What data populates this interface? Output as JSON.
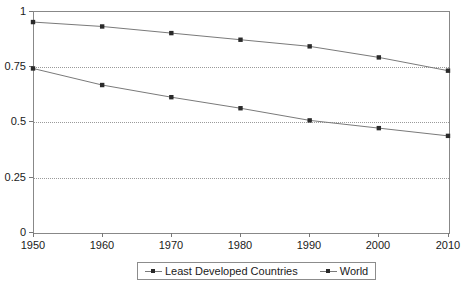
{
  "chart_data": {
    "type": "line",
    "title": "",
    "subtitle": "",
    "xlabel": "",
    "ylabel": "",
    "x": [
      1950,
      1960,
      1970,
      1980,
      1990,
      2000,
      2010
    ],
    "xtick_labels": [
      "1950",
      "1960",
      "1970",
      "1980",
      "1990",
      "2000",
      "2010"
    ],
    "ytick_labels": [
      "0",
      "0.25",
      "0.5",
      "0.75",
      "1"
    ],
    "yticks": [
      0,
      0.25,
      0.5,
      0.75,
      1
    ],
    "xlim": [
      1950,
      2010
    ],
    "ylim": [
      0,
      1
    ],
    "grid": "horizontal-dotted",
    "legend_position": "bottom-center",
    "marker": "square",
    "series": [
      {
        "name": "Least Developed Countries",
        "values": [
          0.95,
          0.93,
          0.9,
          0.87,
          0.84,
          0.79,
          0.73
        ],
        "color": "#7a7a7a",
        "marker_color": "#2a2a2a"
      },
      {
        "name": "World",
        "values": [
          0.74,
          0.665,
          0.61,
          0.56,
          0.505,
          0.47,
          0.435
        ],
        "color": "#7a7a7a",
        "marker_color": "#2a2a2a"
      }
    ]
  },
  "axes": {
    "y_labels": [
      {
        "text": "1",
        "top": 6
      },
      {
        "text": "0.75",
        "top": 61
      },
      {
        "text": "0.5",
        "top": 116
      },
      {
        "text": "0.25",
        "top": 172
      },
      {
        "text": "0",
        "top": 227
      }
    ],
    "x_labels": [
      {
        "text": "1950",
        "left": 33
      },
      {
        "text": "1960",
        "left": 102
      },
      {
        "text": "1970",
        "left": 171
      },
      {
        "text": "1980",
        "left": 240
      },
      {
        "text": "1990",
        "left": 309
      },
      {
        "text": "2000",
        "left": 378
      },
      {
        "text": "2010",
        "left": 448
      }
    ]
  },
  "legend": {
    "entries": [
      {
        "label": "Least Developed Countries"
      },
      {
        "label": "World"
      }
    ]
  },
  "colors": {
    "line": "#7a7a7a",
    "marker": "#2a2a2a",
    "frame": "#888888",
    "gridline": "#9a9a9a",
    "text": "#1a1a1a",
    "background": "#ffffff"
  }
}
